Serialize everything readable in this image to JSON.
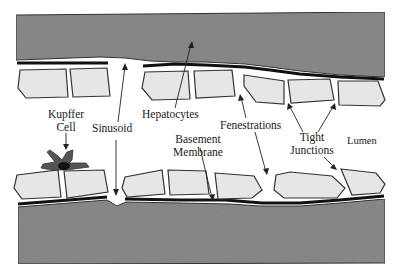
{
  "diagram": {
    "colors": {
      "tissue": "#8a8a8a",
      "cell_fill": "#e6e6e6",
      "cell_outline": "#3a3a3a",
      "membrane": "#1a1a1a",
      "kupffer": "#555555",
      "background": "#ffffff"
    },
    "labels": {
      "kupffer_line1": "Kupffer",
      "kupffer_line2": "Cell",
      "sinusoid": "Sinusoid",
      "hepatocytes": "Hepatocytes",
      "basement_line1": "Basement",
      "basement_line2": "Membrane",
      "fenestrations": "Fenestrations",
      "tight_line1": "Tight",
      "tight_line2": "Junctions",
      "lumen": "Lumen"
    }
  }
}
